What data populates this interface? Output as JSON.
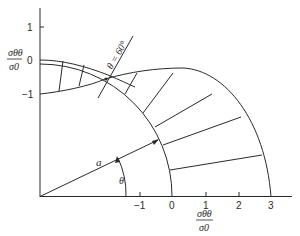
{
  "figure": {
    "type": "polar stress distribution diagram",
    "colors": {
      "line": "#2a2a2a",
      "background": "#ffffff"
    }
  },
  "left_axis": {
    "label_numerator": "σθθ",
    "label_denominator": "σ0",
    "ticks": [
      {
        "value": "1"
      },
      {
        "value": "0"
      },
      {
        "value": "−1"
      }
    ]
  },
  "bottom_axis": {
    "label_numerator": "σθθ",
    "label_denominator": "σ0",
    "ticks": [
      {
        "value": "−1"
      },
      {
        "value": "0"
      },
      {
        "value": "1"
      },
      {
        "value": "2"
      },
      {
        "value": "3"
      }
    ]
  },
  "annotations": {
    "theta_60": "θ = 60°",
    "radius_label": "a",
    "angle_label": "θ"
  }
}
